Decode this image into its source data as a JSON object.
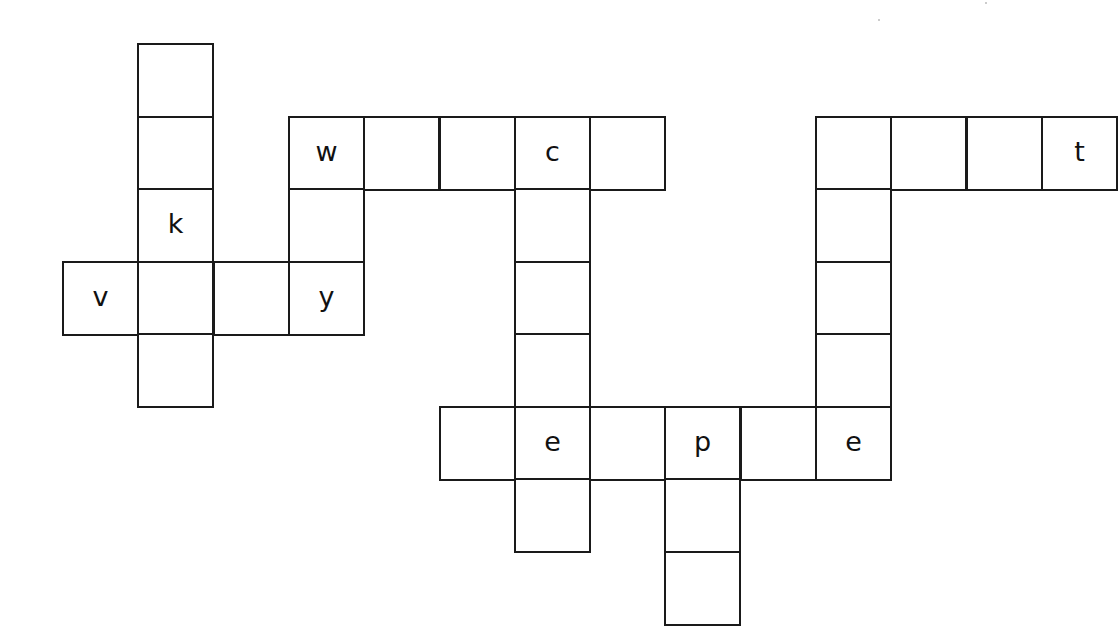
{
  "puzzle": {
    "type": "crossword-grid",
    "grid": {
      "origin_x": 62,
      "origin_y": 43,
      "cell_width": 75.3,
      "cell_height": 72.5
    },
    "colors": {
      "line": "#1a1a1a",
      "background": "#ffffff",
      "text": "#111111"
    },
    "cells": [
      {
        "row": 0,
        "col": 1,
        "letter": ""
      },
      {
        "row": 1,
        "col": 1,
        "letter": ""
      },
      {
        "row": 2,
        "col": 1,
        "letter": "k"
      },
      {
        "row": 3,
        "col": 1,
        "letter": ""
      },
      {
        "row": 4,
        "col": 1,
        "letter": ""
      },
      {
        "row": 3,
        "col": 0,
        "letter": "v"
      },
      {
        "row": 3,
        "col": 2,
        "letter": ""
      },
      {
        "row": 3,
        "col": 3,
        "letter": "y"
      },
      {
        "row": 1,
        "col": 3,
        "letter": "w"
      },
      {
        "row": 2,
        "col": 3,
        "letter": ""
      },
      {
        "row": 1,
        "col": 4,
        "letter": ""
      },
      {
        "row": 1,
        "col": 5,
        "letter": ""
      },
      {
        "row": 1,
        "col": 6,
        "letter": "c"
      },
      {
        "row": 1,
        "col": 7,
        "letter": ""
      },
      {
        "row": 2,
        "col": 6,
        "letter": ""
      },
      {
        "row": 3,
        "col": 6,
        "letter": ""
      },
      {
        "row": 4,
        "col": 6,
        "letter": ""
      },
      {
        "row": 5,
        "col": 6,
        "letter": "e"
      },
      {
        "row": 6,
        "col": 6,
        "letter": ""
      },
      {
        "row": 5,
        "col": 5,
        "letter": ""
      },
      {
        "row": 5,
        "col": 7,
        "letter": ""
      },
      {
        "row": 5,
        "col": 8,
        "letter": "p"
      },
      {
        "row": 5,
        "col": 9,
        "letter": ""
      },
      {
        "row": 5,
        "col": 10,
        "letter": "e"
      },
      {
        "row": 6,
        "col": 8,
        "letter": ""
      },
      {
        "row": 7,
        "col": 8,
        "letter": ""
      },
      {
        "row": 1,
        "col": 10,
        "letter": ""
      },
      {
        "row": 2,
        "col": 10,
        "letter": ""
      },
      {
        "row": 3,
        "col": 10,
        "letter": ""
      },
      {
        "row": 4,
        "col": 10,
        "letter": ""
      },
      {
        "row": 1,
        "col": 11,
        "letter": ""
      },
      {
        "row": 1,
        "col": 12,
        "letter": ""
      },
      {
        "row": 1,
        "col": 13,
        "letter": "t"
      }
    ],
    "words": [
      {
        "direction": "down",
        "start": [
          0,
          1
        ],
        "length": 5,
        "known": "__k__"
      },
      {
        "direction": "across",
        "start": [
          3,
          0
        ],
        "length": 4,
        "known": "v__y"
      },
      {
        "direction": "down",
        "start": [
          1,
          3
        ],
        "length": 3,
        "known": "w_y"
      },
      {
        "direction": "across",
        "start": [
          1,
          3
        ],
        "length": 5,
        "known": "w__c_"
      },
      {
        "direction": "down",
        "start": [
          1,
          6
        ],
        "length": 6,
        "known": "c___e_"
      },
      {
        "direction": "across",
        "start": [
          5,
          5
        ],
        "length": 6,
        "known": "_e_p_e"
      },
      {
        "direction": "down",
        "start": [
          5,
          8
        ],
        "length": 3,
        "known": "p__"
      },
      {
        "direction": "down",
        "start": [
          1,
          10
        ],
        "length": 5,
        "known": "____e"
      },
      {
        "direction": "across",
        "start": [
          1,
          10
        ],
        "length": 4,
        "known": "___t"
      }
    ]
  }
}
